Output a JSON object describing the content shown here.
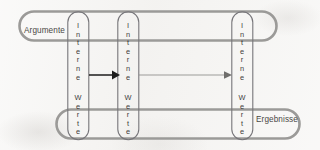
{
  "diagram": {
    "background_color": "#f4f3f1",
    "stroke_color": "#9b9a98",
    "arrow_dark_color": "#1c1c1c",
    "arrow_light_color": "#8d8c8a",
    "text_color": "#3f3d3b"
  },
  "pills": {
    "top": {
      "label": "Argumente",
      "x": 18,
      "y": 10,
      "width": 260,
      "height": 32
    },
    "bottom": {
      "label": "Ergebnisse",
      "x": 55,
      "y": 108,
      "width": 246,
      "height": 32
    }
  },
  "columns": [
    {
      "id": "column-1",
      "upper": "Interne",
      "lower": "Werte",
      "x": 67,
      "y": 11,
      "width": 22,
      "height": 130
    },
    {
      "id": "column-2",
      "upper": "Interne",
      "lower": "Werte",
      "x": 117,
      "y": 11,
      "width": 22,
      "height": 130
    },
    {
      "id": "column-3",
      "upper": "Interne",
      "lower": "Werte",
      "x": 231,
      "y": 11,
      "width": 22,
      "height": 130
    }
  ],
  "column_letters": {
    "upper": [
      "I",
      "n",
      "t",
      "e",
      "r",
      "n",
      "e"
    ],
    "lower": [
      "W",
      "e",
      "r",
      "t",
      "e"
    ]
  },
  "arrows": [
    {
      "id": "arrow-1",
      "from": "column-1",
      "to": "column-2",
      "style": "thick-black",
      "x1": 89,
      "y1": 75,
      "x2": 117,
      "y2": 75
    },
    {
      "id": "arrow-2",
      "from": "column-2",
      "to": "column-3",
      "style": "thin-gray",
      "x1": 139,
      "y1": 75,
      "x2": 231,
      "y2": 75
    }
  ]
}
